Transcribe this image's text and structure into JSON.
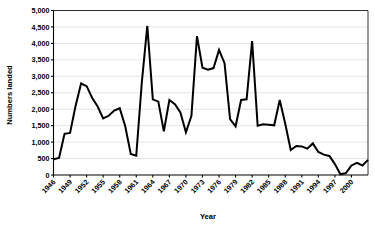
{
  "chart_data": {
    "type": "line",
    "title": "",
    "xlabel": "Year",
    "ylabel": "Numbers  landed",
    "xlim": [
      1946,
      2003
    ],
    "ylim": [
      0,
      5000
    ],
    "ytick_labels": [
      "0",
      "500",
      "1,000",
      "1,500",
      "2,000",
      "2,500",
      "3,000",
      "3,500",
      "4,000",
      "4,500",
      "5,000"
    ],
    "ytick_values": [
      0,
      500,
      1000,
      1500,
      2000,
      2500,
      3000,
      3500,
      4000,
      4500,
      5000
    ],
    "xtick_labels": [
      "1946",
      "1949",
      "1952",
      "1955",
      "1958",
      "1961",
      "1964",
      "1967",
      "1970",
      "1973",
      "1976",
      "1979",
      "1982",
      "1985",
      "1988",
      "1991",
      "1994",
      "1997",
      "2000"
    ],
    "xtick_values": [
      1946,
      1949,
      1952,
      1955,
      1958,
      1961,
      1964,
      1967,
      1970,
      1973,
      1976,
      1979,
      1982,
      1985,
      1988,
      1991,
      1994,
      1997,
      2000
    ],
    "grid": "horizontal",
    "legend": "none",
    "x": [
      1946,
      1947,
      1948,
      1949,
      1950,
      1951,
      1952,
      1953,
      1954,
      1955,
      1956,
      1957,
      1958,
      1959,
      1960,
      1961,
      1962,
      1963,
      1964,
      1965,
      1966,
      1967,
      1968,
      1969,
      1970,
      1971,
      1972,
      1973,
      1974,
      1975,
      1976,
      1977,
      1978,
      1979,
      1980,
      1981,
      1982,
      1983,
      1984,
      1985,
      1986,
      1987,
      1988,
      1989,
      1990,
      1991,
      1992,
      1993,
      1994,
      1995,
      1996,
      1997,
      1998,
      1999,
      2000,
      2001,
      2002,
      2003
    ],
    "values": [
      480,
      520,
      1250,
      1280,
      2100,
      2780,
      2700,
      2350,
      2080,
      1720,
      1800,
      1960,
      2030,
      1480,
      640,
      590,
      2800,
      4530,
      2300,
      2230,
      1330,
      2280,
      2150,
      1900,
      1300,
      1800,
      4220,
      3260,
      3200,
      3250,
      3800,
      3400,
      1700,
      1480,
      2280,
      2300,
      4070,
      1500,
      1540,
      1530,
      1510,
      2280,
      1560,
      760,
      880,
      870,
      800,
      960,
      700,
      620,
      580,
      330,
      20,
      60,
      290,
      370,
      290,
      460
    ],
    "series_name": "Numbers landed"
  }
}
